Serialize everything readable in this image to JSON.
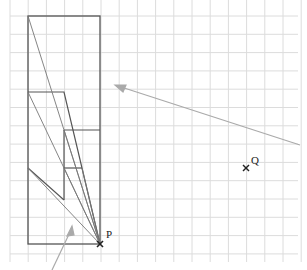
{
  "labels": {
    "p": "P",
    "q": "Q"
  },
  "grid": {
    "x0": 10,
    "y0": 0,
    "step": 18.2,
    "cols": 16,
    "rows": 14,
    "color": "#dcdcdc"
  },
  "colors": {
    "shape": "#555555",
    "ray": "#777777",
    "arrow": "#aaaaaa",
    "point": "#222222"
  }
}
